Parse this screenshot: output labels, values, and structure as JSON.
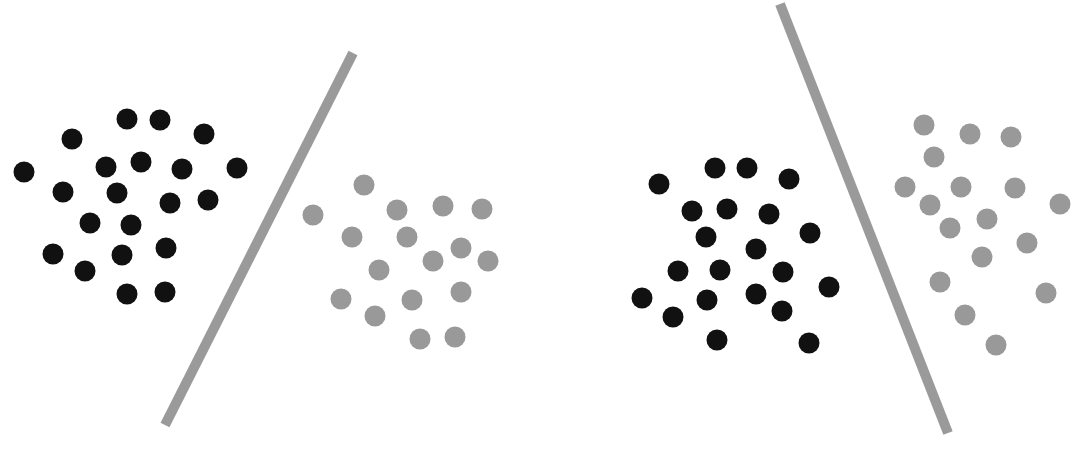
{
  "colors": {
    "background": "#ffffff",
    "class_a": "#111111",
    "class_b": "#999999",
    "separator": "#9a9a9a"
  },
  "dot_radius": 10.5,
  "separator_width": 10,
  "panels": [
    {
      "name": "left-panel",
      "separator": {
        "x1": 353,
        "y1": 53,
        "x2": 165,
        "y2": 425
      },
      "class_a_points": [
        [
          127,
          119
        ],
        [
          160,
          120
        ],
        [
          72,
          139
        ],
        [
          204,
          134
        ],
        [
          24,
          172
        ],
        [
          106,
          167
        ],
        [
          141,
          162
        ],
        [
          182,
          169
        ],
        [
          237,
          168
        ],
        [
          63,
          192
        ],
        [
          117,
          193
        ],
        [
          170,
          203
        ],
        [
          208,
          200
        ],
        [
          90,
          223
        ],
        [
          131,
          225
        ],
        [
          53,
          254
        ],
        [
          122,
          255
        ],
        [
          166,
          248
        ],
        [
          85,
          271
        ],
        [
          127,
          294
        ],
        [
          165,
          292
        ]
      ],
      "class_b_points": [
        [
          364,
          185
        ],
        [
          313,
          215
        ],
        [
          397,
          210
        ],
        [
          443,
          206
        ],
        [
          482,
          209
        ],
        [
          352,
          237
        ],
        [
          407,
          237
        ],
        [
          461,
          248
        ],
        [
          433,
          261
        ],
        [
          488,
          261
        ],
        [
          379,
          270
        ],
        [
          341,
          299
        ],
        [
          412,
          300
        ],
        [
          461,
          292
        ],
        [
          375,
          316
        ],
        [
          420,
          339
        ],
        [
          455,
          337
        ]
      ]
    },
    {
      "name": "right-panel",
      "separator": {
        "x1": 780,
        "y1": 4,
        "x2": 948,
        "y2": 433
      },
      "class_a_points": [
        [
          659,
          184
        ],
        [
          715,
          168
        ],
        [
          747,
          168
        ],
        [
          789,
          179
        ],
        [
          692,
          211
        ],
        [
          727,
          209
        ],
        [
          769,
          214
        ],
        [
          810,
          233
        ],
        [
          706,
          237
        ],
        [
          756,
          249
        ],
        [
          678,
          271
        ],
        [
          720,
          270
        ],
        [
          783,
          272
        ],
        [
          829,
          287
        ],
        [
          642,
          298
        ],
        [
          707,
          300
        ],
        [
          756,
          294
        ],
        [
          782,
          311
        ],
        [
          673,
          317
        ],
        [
          717,
          340
        ],
        [
          809,
          343
        ]
      ],
      "class_b_points": [
        [
          924,
          125
        ],
        [
          970,
          134
        ],
        [
          1011,
          137
        ],
        [
          934,
          157
        ],
        [
          905,
          187
        ],
        [
          961,
          187
        ],
        [
          1015,
          188
        ],
        [
          1060,
          204
        ],
        [
          930,
          205
        ],
        [
          987,
          219
        ],
        [
          950,
          228
        ],
        [
          1027,
          243
        ],
        [
          982,
          257
        ],
        [
          940,
          282
        ],
        [
          1046,
          293
        ],
        [
          965,
          315
        ],
        [
          996,
          345
        ]
      ]
    }
  ]
}
